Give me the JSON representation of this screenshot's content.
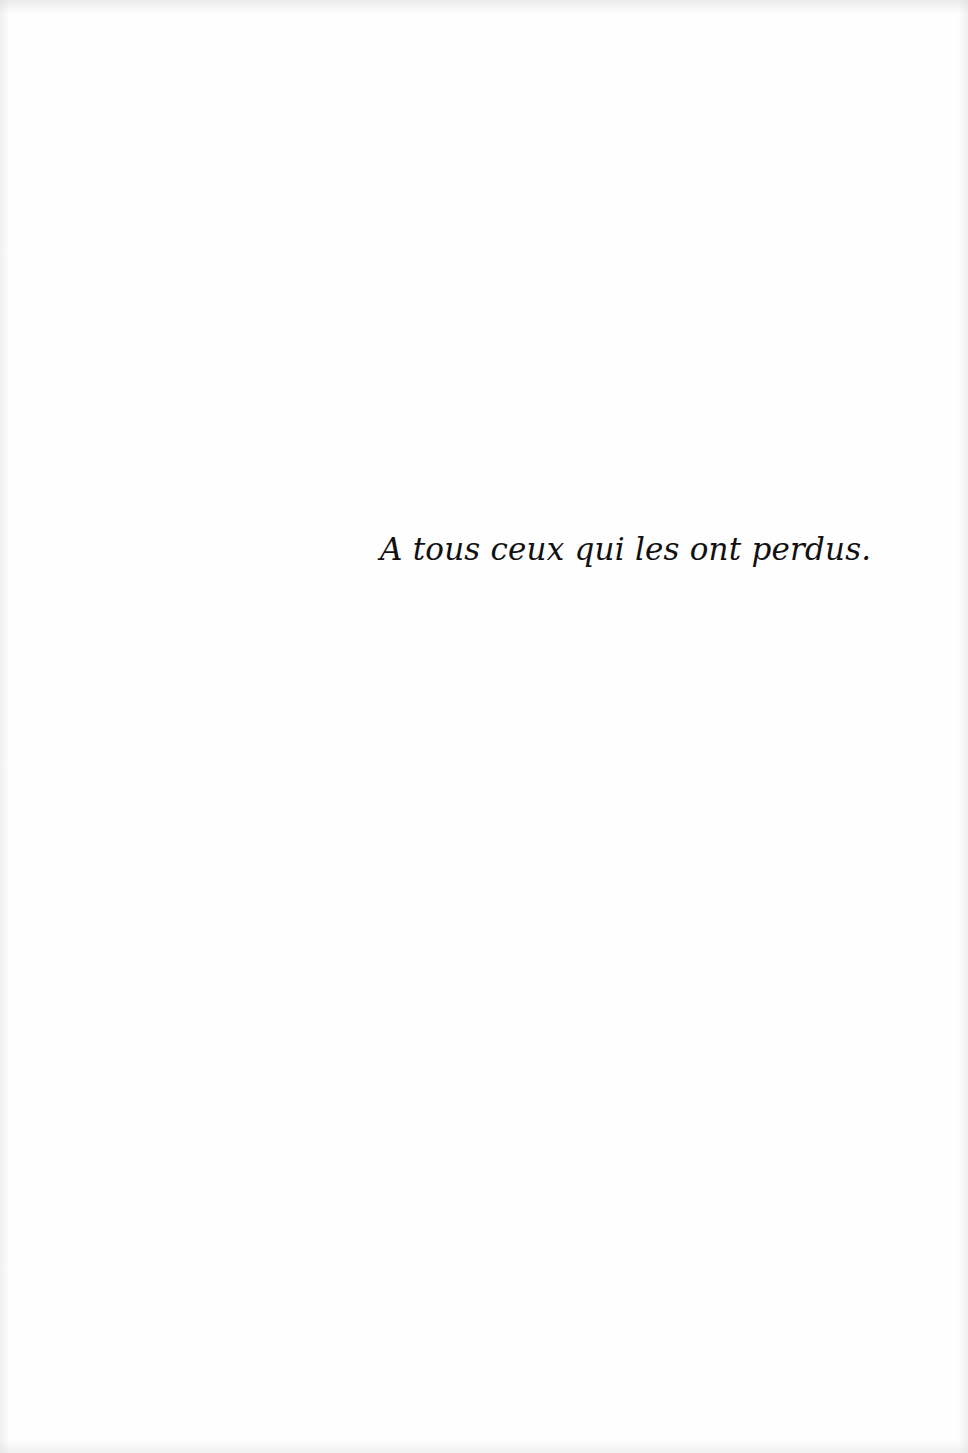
{
  "page": {
    "type": "dedication",
    "dedication_text": "A tous ceux qui les ont perdus.",
    "text_color": "#111111",
    "background_color": "#fefefe"
  }
}
